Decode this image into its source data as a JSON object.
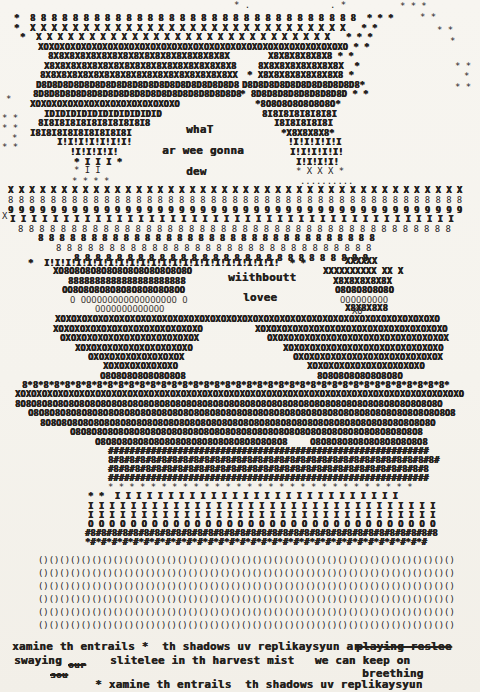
{
  "page": {
    "background": "#f6f4ef",
    "ink": "#24211d"
  },
  "poem": {
    "word_what": "whaT",
    "word_ar_we_gonna": "ar wee gonna",
    "word_dew": "dew",
    "word_without": "wiithboutt",
    "word_love": "lovee",
    "line1": "xamine th entrails *  th shadows uv replikaysyun ar",
    "line1_struck": "playing reslee",
    "line2_start": "swaying",
    "line2_struck_a": "our",
    "line2_struck_b": "sou",
    "line2_rest": "slitelee in th harvest mist   we can keep on",
    "line3": "breething",
    "line4": "* xamine th entrails  th shadows uv replikaysyun"
  },
  "art": {
    "rows": [
      {
        "x": 234,
        "y": 1,
        "t": "* .",
        "n": "top-marks"
      },
      {
        "x": 330,
        "y": 1,
        "t": ". *",
        "n": "top-marks"
      },
      {
        "x": 400,
        "y": 2,
        "t": "* * *",
        "n": "top-marks"
      },
      {
        "x": 14,
        "y": 14,
        "t": "*  {8 |31} * * *",
        "c": "d"
      },
      {
        "x": 420,
        "y": 13,
        "t": "* *"
      },
      {
        "x": 14,
        "y": 24,
        "t": "*  {X |30}  * *",
        "c": "d"
      },
      {
        "x": 437,
        "y": 26,
        "t": "* *"
      },
      {
        "x": 20,
        "y": 33,
        "t": "*  {X |28}  * * *",
        "c": "d"
      },
      {
        "x": 450,
        "y": 37,
        "t": "*"
      },
      {
        "x": 38,
        "y": 43,
        "t": "{XO|29} * *",
        "c": "d"
      },
      {
        "x": 48,
        "y": 52,
        "t": "{8X|17}",
        "c": "d"
      },
      {
        "x": 268,
        "y": 52,
        "t": "{X8|6} * *",
        "c": "d"
      },
      {
        "x": 44,
        "y": 62,
        "t": "{X8|18}",
        "c": "d"
      },
      {
        "x": 258,
        "y": 62,
        "t": "{8X|8}  *",
        "c": "d"
      },
      {
        "x": 455,
        "y": 62,
        "t": "* *"
      },
      {
        "x": 40,
        "y": 71,
        "t": "{8X|18}X",
        "c": "d"
      },
      {
        "x": 247,
        "y": 71,
        "t": "* {X8|8} *",
        "c": "d"
      },
      {
        "x": 464,
        "y": 72,
        "t": "*"
      },
      {
        "x": 36,
        "y": 81,
        "t": "{D8|19}",
        "c": "d"
      },
      {
        "x": 242,
        "y": 81,
        "t": "{D8|11}*",
        "c": "d"
      },
      {
        "x": 455,
        "y": 83,
        "t": "* *"
      },
      {
        "x": 33,
        "y": 90,
        "t": "{8D|19}8",
        "c": "d"
      },
      {
        "x": 240,
        "y": 90,
        "t": "* {8D|9} * *",
        "c": "d"
      },
      {
        "x": 6,
        "y": 95,
        "t": "*"
      },
      {
        "x": 30,
        "y": 100,
        "t": "{XO|14}",
        "c": "d"
      },
      {
        "x": 255,
        "y": 100,
        "t": "*{8O|7}*",
        "c": "d"
      },
      {
        "x": 44,
        "y": 110,
        "t": "{ID|11}",
        "c": "d"
      },
      {
        "x": 262,
        "y": 110,
        "t": "{8I|7}",
        "c": "d"
      },
      {
        "x": 2,
        "y": 114,
        "t": "* *"
      },
      {
        "x": 38,
        "y": 119,
        "t": "{8I|10}8",
        "c": "d"
      },
      {
        "x": 274,
        "y": 119,
        "t": "{I8|5}I",
        "c": "d"
      },
      {
        "x": 2,
        "y": 124,
        "t": "* *"
      },
      {
        "x": 30,
        "y": 129,
        "t": "{I8|9}I",
        "c": "d"
      },
      {
        "x": 281,
        "y": 129,
        "t": "*{X8|4}*",
        "c": "d"
      },
      {
        "x": 12,
        "y": 134,
        "t": "*"
      },
      {
        "x": 57,
        "y": 138,
        "t": "{I!|7}",
        "c": "d"
      },
      {
        "x": 288,
        "y": 138,
        "t": "{!I|5}",
        "c": "d"
      },
      {
        "x": 2,
        "y": 143,
        "t": "* *"
      },
      {
        "x": 70,
        "y": 148,
        "t": "{!I|4}!",
        "c": "d"
      },
      {
        "x": 290,
        "y": 148,
        "t": "{I!|5}",
        "c": "d"
      },
      {
        "x": 74,
        "y": 158,
        "t": "* I I I *",
        "c": "d"
      },
      {
        "x": 296,
        "y": 158,
        "t": "{I!|4}",
        "c": "d"
      },
      {
        "x": 74,
        "y": 166,
        "t": "* I I"
      },
      {
        "x": 296,
        "y": 167,
        "t": "* X X X *"
      },
      {
        "x": 72,
        "y": 177,
        "t": "* * * *"
      },
      {
        "x": 300,
        "y": 177,
        "t": ".........."
      },
      {
        "x": 8,
        "y": 186,
        "t": "{X |43}",
        "c": "d"
      },
      {
        "x": 8,
        "y": 196,
        "t": "{8 |43}"
      },
      {
        "x": 8,
        "y": 206,
        "t": "{9 |43}",
        "c": "d"
      },
      {
        "x": 2,
        "y": 212,
        "t": "X"
      },
      {
        "x": 10,
        "y": 215,
        "t": "{I |42}",
        "c": "d"
      },
      {
        "x": 18,
        "y": 225,
        "t": "{8 |41}"
      },
      {
        "x": 38,
        "y": 234,
        "t": "{8 |32}",
        "c": "d"
      },
      {
        "x": 56,
        "y": 244,
        "t": "{8 |30}"
      },
      {
        "x": 74,
        "y": 254,
        "t": "{8 |28}",
        "c": "d"
      },
      {
        "x": 28,
        "y": 259,
        "t": "*  {I!|22}  * *",
        "c": "d"
      },
      {
        "x": 345,
        "y": 257,
        "t": "{X|6}",
        "c": "d"
      },
      {
        "x": 53,
        "y": 267,
        "t": "X{O8|12}O",
        "c": "d"
      },
      {
        "x": 323,
        "y": 267,
        "t": "{X|10} XX X",
        "c": "d"
      },
      {
        "x": 68,
        "y": 277,
        "t": "{8|22}",
        "c": "d"
      },
      {
        "x": 333,
        "y": 277,
        "t": "{X8|5}X",
        "c": "d"
      },
      {
        "x": 62,
        "y": 286,
        "t": "OO{8O|10}O",
        "c": "d"
      },
      {
        "x": 335,
        "y": 286,
        "t": "{O8|5}O",
        "c": "d"
      },
      {
        "x": 70,
        "y": 296,
        "t": "O {O|18} O",
        "c": "o"
      },
      {
        "x": 340,
        "y": 296,
        "t": "{O|9}",
        "c": "o"
      },
      {
        "x": 95,
        "y": 305,
        "t": "{O|13}",
        "c": "o"
      },
      {
        "x": 345,
        "y": 304,
        "t": "{X8|4}",
        "c": "d"
      },
      {
        "x": 352,
        "y": 307,
        "t": "XO"
      },
      {
        "x": 55,
        "y": 315,
        "t": "{XO|36}",
        "c": "d"
      },
      {
        "x": 53,
        "y": 325,
        "t": "{XO|14}",
        "c": "d"
      },
      {
        "x": 255,
        "y": 325,
        "t": "{XO|18}",
        "c": "d"
      },
      {
        "x": 60,
        "y": 334,
        "t": "{OX|13}",
        "c": "d"
      },
      {
        "x": 267,
        "y": 334,
        "t": "{OX|17}",
        "c": "d"
      },
      {
        "x": 75,
        "y": 344,
        "t": "{XO|11}",
        "c": "d"
      },
      {
        "x": 283,
        "y": 344,
        "t": "{XO|15}",
        "c": "d"
      },
      {
        "x": 88,
        "y": 353,
        "t": "{OX|9}",
        "c": "d"
      },
      {
        "x": 293,
        "y": 353,
        "t": "{OX|14}",
        "c": "d"
      },
      {
        "x": 103,
        "y": 362,
        "t": "{XO|7}",
        "c": "d"
      },
      {
        "x": 307,
        "y": 362,
        "t": "{XO|11}",
        "c": "d"
      },
      {
        "x": 100,
        "y": 372,
        "t": "{O8|8}",
        "c": "d"
      },
      {
        "x": 317,
        "y": 372,
        "t": "{8O|8}",
        "c": "d"
      },
      {
        "x": 22,
        "y": 381,
        "t": "{8*|40}",
        "c": "d"
      },
      {
        "x": 15,
        "y": 390,
        "t": "{XO|42}",
        "c": "d"
      },
      {
        "x": 15,
        "y": 400,
        "t": "{8O|40}",
        "c": "d"
      },
      {
        "x": 28,
        "y": 409,
        "t": "{O8|40}",
        "c": "d"
      },
      {
        "x": 40,
        "y": 419,
        "t": "{8O|37}",
        "c": "d"
      },
      {
        "x": 70,
        "y": 428,
        "t": "{O8|33}",
        "c": "d"
      },
      {
        "x": 95,
        "y": 438,
        "t": "{O8|18}",
        "c": "d"
      },
      {
        "x": 310,
        "y": 438,
        "t": "{O8|11}",
        "c": "d"
      },
      {
        "x": 108,
        "y": 447,
        "t": "{#|60}",
        "c": "d"
      },
      {
        "x": 108,
        "y": 456,
        "t": "{8#|31}",
        "c": "d"
      },
      {
        "x": 108,
        "y": 465,
        "t": "{#8|30}",
        "c": "d"
      },
      {
        "x": 108,
        "y": 474,
        "t": "{#|60}",
        "c": "d"
      },
      {
        "x": 108,
        "y": 483,
        "t": "{* |29}"
      },
      {
        "x": 88,
        "y": 492,
        "t": "* *  {I |27}",
        "c": "d"
      },
      {
        "x": 88,
        "y": 502,
        "t": "{I |33}",
        "c": "d"
      },
      {
        "x": 88,
        "y": 511,
        "t": "{I |33}",
        "c": "d"
      },
      {
        "x": 88,
        "y": 520,
        "t": "{O |33}",
        "c": "d"
      },
      {
        "x": 85,
        "y": 529,
        "t": "{#8|33}",
        "c": "d"
      },
      {
        "x": 85,
        "y": 538,
        "t": "{*#|32}",
        "c": "d"
      },
      {
        "x": 38,
        "y": 556,
        "t": "{()|39}",
        "n": "bars-row"
      },
      {
        "x": 38,
        "y": 569,
        "t": "{()|39}",
        "n": "bars-row"
      },
      {
        "x": 38,
        "y": 582,
        "t": "{()|39}",
        "n": "bars-row"
      },
      {
        "x": 38,
        "y": 595,
        "t": "{()|39}",
        "n": "bars-row"
      },
      {
        "x": 38,
        "y": 608,
        "t": "{()|39}",
        "n": "bars-row"
      },
      {
        "x": 38,
        "y": 621,
        "t": "{()|39}",
        "n": "bars-row"
      },
      {
        "x": 186,
        "y": 124,
        "t": "whaT",
        "c": "w",
        "n": "word-what"
      },
      {
        "x": 162,
        "y": 145,
        "t": "ar wee gonna",
        "c": "w",
        "n": "word-ar-we-gonna"
      },
      {
        "x": 186,
        "y": 166,
        "t": "dew",
        "c": "w",
        "n": "word-dew"
      },
      {
        "x": 228,
        "y": 272,
        "t": "wiithboutt",
        "c": "w",
        "n": "word-without"
      },
      {
        "x": 243,
        "y": 292,
        "t": "lovee",
        "c": "w",
        "n": "word-love"
      },
      {
        "x": 12,
        "y": 641,
        "t": "xamine th entrails *  th shadows uv replikaysyun ar",
        "c": "w",
        "n": "poem-line-1"
      },
      {
        "x": 356,
        "y": 641,
        "t": "playing reslee",
        "c": "w s",
        "n": "struck-playing-reslee"
      },
      {
        "x": 14,
        "y": 655,
        "t": "swaying",
        "c": "w",
        "n": "poem-line-2-swaying"
      },
      {
        "x": 68,
        "y": 660,
        "t": "our",
        "c": "w s sm",
        "n": "struck-our"
      },
      {
        "x": 110,
        "y": 655,
        "t": "slitelee in th harvest mist   we can keep on",
        "c": "w",
        "n": "poem-line-2"
      },
      {
        "x": 50,
        "y": 670,
        "t": "sou",
        "c": "w s sm",
        "n": "struck-sou"
      },
      {
        "x": 362,
        "y": 668,
        "t": "breething",
        "c": "w",
        "n": "poem-line-3-breething"
      },
      {
        "x": 95,
        "y": 679,
        "t": "* xamine th entrails  th shadows uv replikaysyun",
        "c": "w",
        "n": "poem-line-4"
      }
    ]
  }
}
